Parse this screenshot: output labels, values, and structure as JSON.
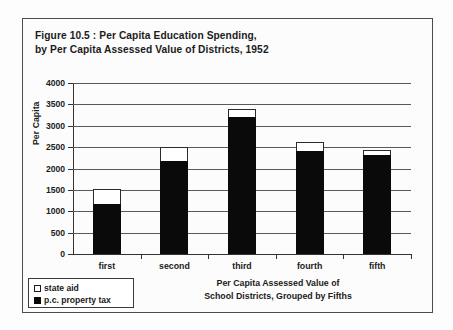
{
  "figure": {
    "title_line1": "Figure 10.5 : Per Capita Education Spending,",
    "title_line2": "by Per Capita Assessed Value of Districts, 1952"
  },
  "legend": {
    "items": [
      {
        "label": "state aid",
        "color": "#ffffff",
        "swatch": "open-square-swatch"
      },
      {
        "label": "p.c. property tax",
        "color": "#0a0a0a",
        "swatch": "filled-square-swatch"
      }
    ]
  },
  "axes": {
    "y_title": "Per Capita",
    "x_title_line1": "Per Capita Assessed Value of",
    "x_title_line2": "School Districts, Grouped by Fifths",
    "y_ticks": [
      "4000",
      "3500",
      "3000",
      "2500",
      "2000",
      "1500",
      "1000",
      "500",
      "0"
    ]
  },
  "chart_data": {
    "type": "bar",
    "title": "Figure 10.5 : Per Capita Education Spending, by Per Capita Assessed Value of Districts, 1952",
    "subtitle": "",
    "xlabel": "Per Capita Assessed Value of School Districts, Grouped by Fifths",
    "ylabel": "Per Capita",
    "ylim": [
      0,
      4000
    ],
    "ytick_step": 500,
    "grid": true,
    "stacked": true,
    "legend_position": "bottom-left",
    "categories": [
      "first",
      "second",
      "third",
      "fourth",
      "fifth"
    ],
    "series": [
      {
        "name": "p.c. property tax",
        "color": "#0a0a0a",
        "values": [
          1180,
          2180,
          3200,
          2410,
          2320
        ]
      },
      {
        "name": "state aid",
        "color": "#ffffff",
        "values": [
          340,
          320,
          200,
          200,
          110
        ]
      }
    ],
    "totals": [
      1520,
      2500,
      3400,
      2610,
      2430
    ]
  }
}
